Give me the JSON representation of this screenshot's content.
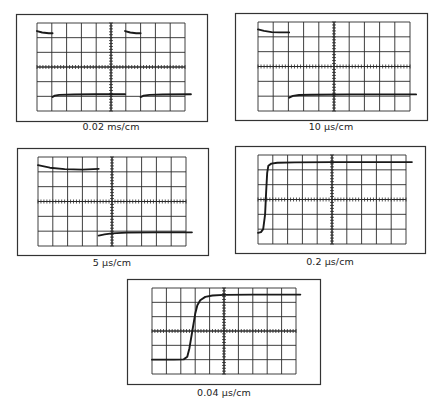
{
  "figure": {
    "grid": {
      "columns": 10,
      "rows": 6,
      "minor_ticks_per_division": 5
    },
    "colors": {
      "trace": "#1a1a1a",
      "grid": "#2a2a2a",
      "frame": "#333333",
      "background": "#ffffff"
    },
    "panels": [
      {
        "id": "p1",
        "caption": "0.02 ms/cm",
        "frame": [
          16,
          14,
          207,
          121
        ],
        "screen": [
          37,
          23,
          185,
          111
        ],
        "segments": [
          {
            "kind": "high",
            "points": [
              [
                0.0,
                0.55
              ],
              [
                0.35,
                0.65
              ],
              [
                0.8,
                0.7
              ],
              [
                1.05,
                0.7
              ]
            ]
          },
          {
            "kind": "low",
            "points": [
              [
                1.05,
                5.05
              ],
              [
                1.2,
                4.95
              ],
              [
                1.5,
                4.9
              ],
              [
                2.5,
                4.88
              ],
              [
                4.0,
                4.86
              ],
              [
                5.95,
                4.86
              ]
            ]
          },
          {
            "kind": "high",
            "points": [
              [
                5.95,
                0.55
              ],
              [
                6.3,
                0.65
              ],
              [
                6.7,
                0.7
              ],
              [
                7.0,
                0.7
              ]
            ]
          },
          {
            "kind": "low",
            "points": [
              [
                7.0,
                5.05
              ],
              [
                7.2,
                4.95
              ],
              [
                7.6,
                4.9
              ],
              [
                8.5,
                4.88
              ],
              [
                10.4,
                4.86
              ]
            ]
          }
        ]
      },
      {
        "id": "p2",
        "caption": "10 µs/cm",
        "frame": [
          235,
          13,
          427,
          120
        ],
        "screen": [
          258,
          22,
          410,
          111
        ],
        "segments": [
          {
            "kind": "high",
            "points": [
              [
                0.0,
                0.5
              ],
              [
                0.4,
                0.6
              ],
              [
                0.9,
                0.68
              ],
              [
                1.4,
                0.7
              ],
              [
                2.05,
                0.7
              ]
            ]
          },
          {
            "kind": "low",
            "points": [
              [
                2.05,
                5.1
              ],
              [
                2.3,
                4.98
              ],
              [
                2.7,
                4.92
              ],
              [
                3.5,
                4.9
              ],
              [
                6.0,
                4.88
              ],
              [
                10.4,
                4.88
              ]
            ]
          }
        ]
      },
      {
        "id": "p3",
        "caption": "5 µs/cm",
        "frame": [
          17,
          148,
          208,
          255
        ],
        "screen": [
          38,
          157,
          186,
          246
        ],
        "segments": [
          {
            "kind": "high",
            "points": [
              [
                0.0,
                0.55
              ],
              [
                0.8,
                0.72
              ],
              [
                1.8,
                0.82
              ],
              [
                3.0,
                0.85
              ],
              [
                4.1,
                0.8
              ]
            ]
          },
          {
            "kind": "low",
            "points": [
              [
                4.1,
                5.3
              ],
              [
                4.5,
                5.22
              ],
              [
                5.0,
                5.15
              ],
              [
                6.0,
                5.1
              ],
              [
                8.0,
                5.08
              ],
              [
                10.4,
                5.08
              ]
            ]
          }
        ]
      },
      {
        "id": "p4",
        "caption": "0.2 µs/cm",
        "frame": [
          235,
          146,
          425,
          253
        ],
        "screen": [
          258,
          155,
          406,
          244
        ],
        "segments": [
          {
            "kind": "step",
            "points": [
              [
                0.0,
                5.25
              ],
              [
                0.2,
                5.2
              ],
              [
                0.35,
                5.0
              ],
              [
                0.48,
                4.0
              ],
              [
                0.55,
                2.5
              ],
              [
                0.62,
                1.2
              ],
              [
                0.7,
                0.72
              ],
              [
                0.9,
                0.58
              ],
              [
                1.3,
                0.52
              ],
              [
                2.5,
                0.5
              ],
              [
                5.0,
                0.48
              ],
              [
                10.4,
                0.48
              ]
            ]
          }
        ]
      },
      {
        "id": "p5",
        "caption": "0.04 µs/cm",
        "frame": [
          127,
          279,
          320,
          384
        ],
        "screen": [
          152,
          288,
          296,
          374
        ],
        "segments": [
          {
            "kind": "step",
            "points": [
              [
                0.0,
                5.0
              ],
              [
                1.5,
                5.0
              ],
              [
                2.2,
                4.98
              ],
              [
                2.45,
                4.8
              ],
              [
                2.6,
                4.2
              ],
              [
                2.8,
                3.0
              ],
              [
                3.0,
                1.8
              ],
              [
                3.15,
                1.2
              ],
              [
                3.35,
                0.85
              ],
              [
                3.7,
                0.62
              ],
              [
                4.2,
                0.52
              ],
              [
                5.0,
                0.48
              ],
              [
                7.0,
                0.46
              ],
              [
                10.3,
                0.46
              ]
            ]
          }
        ]
      }
    ]
  }
}
